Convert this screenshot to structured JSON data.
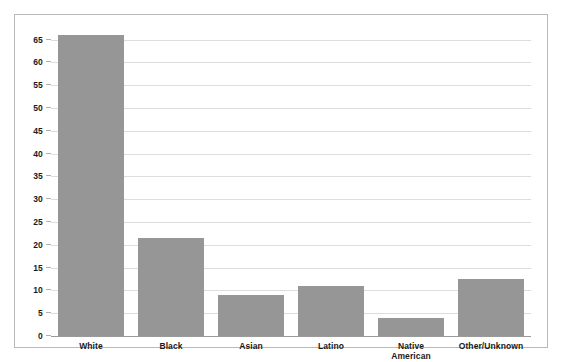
{
  "chart_data": {
    "type": "bar",
    "title": "",
    "subtitle": "",
    "xlabel": "",
    "ylabel": "",
    "categories": [
      "White",
      "Black",
      "Asian",
      "Latino",
      "Native American",
      "Other/Unknown"
    ],
    "category_lines": [
      [
        "White"
      ],
      [
        "Black"
      ],
      [
        "Asian"
      ],
      [
        "Latino"
      ],
      [
        "Native",
        "American"
      ],
      [
        "Other/Unknown"
      ]
    ],
    "values": [
      66,
      21.5,
      9,
      11,
      4,
      12.5
    ],
    "ylim": [
      0,
      68
    ],
    "yticks": [
      0,
      5,
      10,
      15,
      20,
      25,
      30,
      35,
      40,
      45,
      50,
      55,
      60,
      65
    ],
    "ytick_labels": [
      "0",
      "5",
      "10",
      "15",
      "20",
      "25",
      "30",
      "35",
      "40",
      "45",
      "50",
      "55",
      "60",
      "65"
    ],
    "grid": true,
    "legend": false,
    "legend_position": "none",
    "bar_color": "#969696",
    "grid_color": "#dddddd",
    "axis_color": "#9a9a9a",
    "border_color": "#b9b9b9",
    "background_color": "#ffffff"
  }
}
